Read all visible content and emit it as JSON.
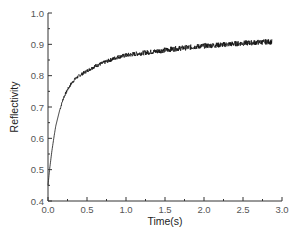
{
  "chart_data": {
    "type": "line",
    "title": "",
    "xlabel": "Time(s)",
    "ylabel": "Reflectivity",
    "xlim": [
      0.0,
      3.0
    ],
    "ylim": [
      0.4,
      1.0
    ],
    "grid": false,
    "legend": null,
    "x_ticks": [
      "0.0",
      "0.5",
      "1.0",
      "1.5",
      "2.0",
      "2.5",
      "3.0"
    ],
    "y_ticks": [
      "0.4",
      "0.5",
      "0.6",
      "0.7",
      "0.8",
      "0.9",
      "1.0"
    ],
    "series": [
      {
        "name": "Reflectivity",
        "color": "#111111",
        "noisy": true,
        "x": [
          0.0,
          0.02,
          0.05,
          0.08,
          0.1,
          0.15,
          0.2,
          0.25,
          0.3,
          0.35,
          0.4,
          0.5,
          0.6,
          0.7,
          0.8,
          0.9,
          1.0,
          1.2,
          1.4,
          1.6,
          1.8,
          2.0,
          2.2,
          2.4,
          2.6,
          2.8,
          2.87
        ],
        "y": [
          0.45,
          0.5,
          0.56,
          0.61,
          0.64,
          0.69,
          0.73,
          0.755,
          0.775,
          0.79,
          0.8,
          0.815,
          0.83,
          0.84,
          0.85,
          0.86,
          0.865,
          0.872,
          0.878,
          0.885,
          0.89,
          0.895,
          0.898,
          0.902,
          0.905,
          0.908,
          0.908
        ]
      }
    ]
  }
}
